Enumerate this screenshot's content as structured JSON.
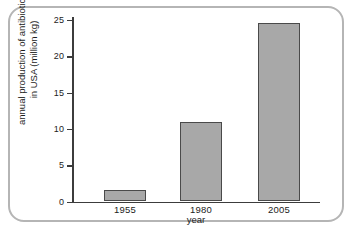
{
  "chart_data": {
    "type": "bar",
    "title": "",
    "subtitle": "",
    "xlabel": "year",
    "ylabel_line1": "annual production of antibiotics",
    "ylabel_line2": "in USA (million kg)",
    "ylabel": "annual production of antibiotics in USA (million kg)",
    "categories": [
      "1955",
      "1980",
      "2005"
    ],
    "values": [
      1.6,
      11.0,
      24.6
    ],
    "ylim": [
      0,
      25
    ],
    "yticks": [
      0,
      5,
      10,
      15,
      20,
      25
    ],
    "ytick_labels": [
      "0",
      "5",
      "10",
      "15",
      "20",
      "25"
    ],
    "grid": false,
    "legend": null,
    "legend_position": "none",
    "bar_fill_color": "#a8a8a8",
    "bar_edge_color": "#4a4a4a",
    "axis_color": "#3c3c3c",
    "frame_color": "#b5b5b5",
    "background_color": "#ffffff"
  }
}
